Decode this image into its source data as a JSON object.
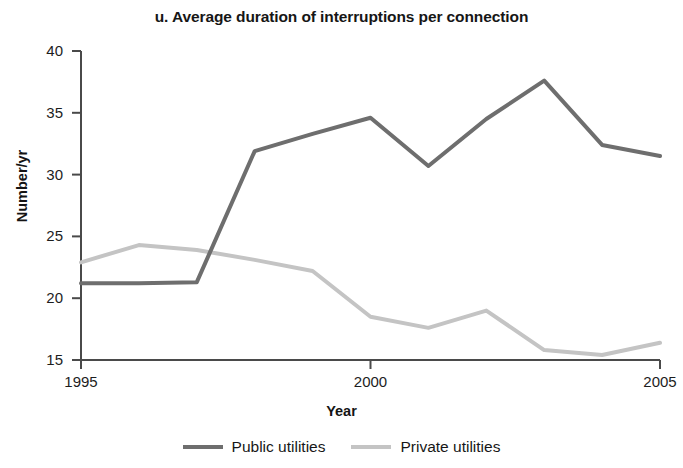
{
  "chart_data": {
    "type": "line",
    "title": "u. Average duration of interruptions per connection",
    "xlabel": "Year",
    "ylabel": "Number/yr",
    "x": [
      1995,
      1996,
      1997,
      1998,
      1999,
      2000,
      2001,
      2002,
      2003,
      2004,
      2005
    ],
    "xlim": [
      1995,
      2005
    ],
    "ylim": [
      15,
      40
    ],
    "xticks": [
      "1995",
      "2000",
      "2005"
    ],
    "xtick_values": [
      1995,
      2000,
      2005
    ],
    "yticks": [
      "15",
      "20",
      "25",
      "30",
      "35",
      "40"
    ],
    "ytick_values": [
      15,
      20,
      25,
      30,
      35,
      40
    ],
    "grid": false,
    "legend_position": "bottom",
    "series": [
      {
        "name": "Public utilities",
        "color": "#6e6e6e",
        "values": [
          21.2,
          21.2,
          21.3,
          31.9,
          33.3,
          34.6,
          30.7,
          34.5,
          37.6,
          32.4,
          31.5
        ]
      },
      {
        "name": "Private utilities",
        "color": "#c4c4c4",
        "values": [
          22.9,
          24.3,
          23.9,
          23.1,
          22.2,
          18.5,
          17.6,
          19.0,
          15.8,
          15.4,
          16.4
        ]
      }
    ]
  },
  "axes": {
    "axis_color": "#4a4a4a"
  }
}
